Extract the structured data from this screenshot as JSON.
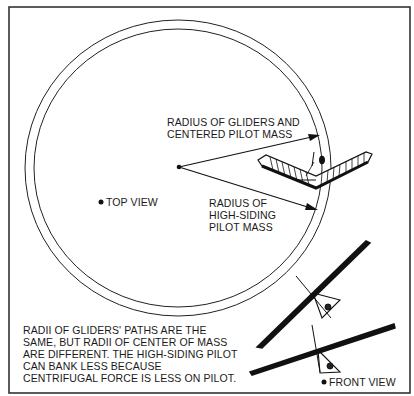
{
  "diagram": {
    "colors": {
      "ink": "#1a1a1a",
      "frame": "#333333",
      "background": "#ffffff"
    },
    "labels": {
      "radius_gliders": [
        "RADIUS OF GLIDERS AND",
        "CENTERED PILOT MASS"
      ],
      "radius_high_siding": [
        "RADIUS OF",
        "HIGH-SIDING",
        "PILOT MASS"
      ],
      "top_view": "TOP VIEW",
      "front_view": "FRONT VIEW"
    },
    "caption": [
      "RADII OF GLIDERS' PATHS ARE THE",
      "SAME, BUT RADII OF CENTER OF MASS",
      "ARE DIFFERENT. THE HIGH-SIDING PILOT",
      "CAN BANK LESS BECAUSE",
      "CENTRIFUGAL FORCE IS LESS ON PILOT."
    ]
  }
}
